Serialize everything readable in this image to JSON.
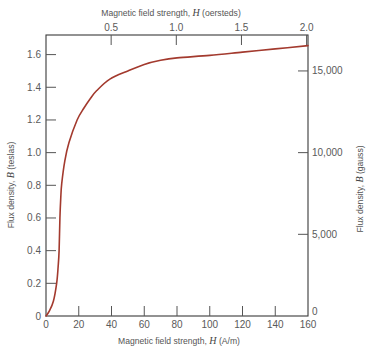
{
  "chart_data": {
    "type": "line",
    "title": "",
    "xlabel": "Magnetic field strength, H (A/m)",
    "ylabel": "Flux density, B (teslas)",
    "x2label": "Magnetic field strength, H (oersteds)",
    "y2label": "Flux density, B (gauss)",
    "xlim": [
      0,
      160
    ],
    "ylim": [
      0,
      1.72
    ],
    "grid": false,
    "legend": null,
    "x_ticks": [
      0,
      20,
      40,
      60,
      80,
      100,
      120,
      140,
      160
    ],
    "x_tick_labels": [
      "0",
      "20",
      "40",
      "60",
      "80",
      "100",
      "120",
      "140",
      "160"
    ],
    "y_ticks": [
      0,
      0.2,
      0.4,
      0.6,
      0.8,
      1.0,
      1.2,
      1.4,
      1.6
    ],
    "y_tick_labels": [
      "0",
      "0.2",
      "0.4",
      "0.6",
      "0.8",
      "1.0",
      "1.2",
      "1.4",
      "1.6"
    ],
    "x2_ticks": [
      0.5,
      1.0,
      1.5,
      2.0
    ],
    "x2_tick_labels": [
      "0.5",
      "1.0",
      "1.5",
      "2.0"
    ],
    "x2_unit_in_x": 79.577,
    "y2_ticks": [
      0,
      5000,
      10000,
      15000
    ],
    "y2_tick_labels": [
      "0",
      "5,000",
      "10,000",
      "15,000"
    ],
    "y2_unit_in_y": 0.0001,
    "series": [
      {
        "name": "B-H magnetization curve",
        "color": "#a33a2e",
        "x": [
          0,
          2,
          4.5,
          6.5,
          7.4,
          8.0,
          8.5,
          9.0,
          9.6,
          11.5,
          14,
          19,
          23,
          27,
          31,
          39,
          50,
          60,
          70,
          80,
          100,
          120,
          140,
          160
        ],
        "y": [
          0,
          0.03,
          0.09,
          0.2,
          0.3,
          0.4,
          0.6,
          0.72,
          0.81,
          0.95,
          1.06,
          1.2,
          1.27,
          1.33,
          1.38,
          1.45,
          1.5,
          1.54,
          1.565,
          1.58,
          1.595,
          1.615,
          1.635,
          1.655
        ]
      }
    ]
  },
  "axes": {
    "bottom_title": {
      "prefix": "Magnetic field strength, ",
      "var": "H",
      "suffix": " (A/m)"
    },
    "top_title": {
      "prefix": "Magnetic field strength, ",
      "var": "H",
      "suffix": " (oersteds)"
    },
    "left_title": {
      "prefix": "Flux density, ",
      "var": "B",
      "suffix": " (teslas)"
    },
    "right_title": {
      "prefix": "Flux density, ",
      "var": "B",
      "suffix": " (gauss)"
    }
  }
}
